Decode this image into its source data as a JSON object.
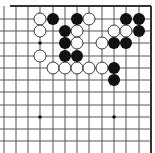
{
  "game": "go",
  "board": {
    "background": "#ffffff",
    "line_color": "#555555",
    "border_color": "#333333",
    "visible_cols": [
      6,
      7,
      8,
      9,
      10,
      11,
      12,
      13,
      14,
      15,
      16,
      17,
      18
    ],
    "visible_rows": [
      0,
      1,
      2,
      3,
      4,
      5,
      6,
      7,
      8,
      9,
      10,
      11
    ],
    "col_x": {
      "6": 4,
      "7": 16,
      "8": 28,
      "9": 40,
      "10": 53,
      "11": 65,
      "12": 77,
      "13": 89,
      "14": 102,
      "15": 114,
      "16": 126,
      "17": 139,
      "18": 151
    },
    "row_y": {
      "0": 6,
      "1": 19,
      "2": 31,
      "3": 43,
      "4": 56,
      "5": 68,
      "6": 80,
      "7": 92,
      "8": 105,
      "9": 117,
      "10": 129,
      "11": 141
    },
    "hoshi": [
      [
        9,
        3
      ],
      [
        15,
        3
      ],
      [
        9,
        9
      ],
      [
        15,
        9
      ]
    ],
    "stones": [
      {
        "color": "white",
        "col": 9,
        "row": 1
      },
      {
        "color": "black",
        "col": 10,
        "row": 1
      },
      {
        "color": "black",
        "col": 12,
        "row": 1
      },
      {
        "color": "white",
        "col": 13,
        "row": 1
      },
      {
        "color": "black",
        "col": 16,
        "row": 1
      },
      {
        "color": "black",
        "col": 17,
        "row": 1
      },
      {
        "color": "white",
        "col": 9,
        "row": 2
      },
      {
        "color": "black",
        "col": 11,
        "row": 2
      },
      {
        "color": "white",
        "col": 12,
        "row": 2
      },
      {
        "color": "white",
        "col": 15,
        "row": 2
      },
      {
        "color": "white",
        "col": 16,
        "row": 2
      },
      {
        "color": "black",
        "col": 17,
        "row": 2
      },
      {
        "color": "black",
        "col": 11,
        "row": 3
      },
      {
        "color": "white",
        "col": 12,
        "row": 3
      },
      {
        "color": "white",
        "col": 14,
        "row": 3
      },
      {
        "color": "black",
        "col": 15,
        "row": 3
      },
      {
        "color": "black",
        "col": 16,
        "row": 3
      },
      {
        "color": "white",
        "col": 9,
        "row": 4
      },
      {
        "color": "black",
        "col": 11,
        "row": 4
      },
      {
        "color": "black",
        "col": 12,
        "row": 4
      },
      {
        "color": "white",
        "col": 10,
        "row": 5
      },
      {
        "color": "white",
        "col": 11,
        "row": 5
      },
      {
        "color": "white",
        "col": 12,
        "row": 5
      },
      {
        "color": "white",
        "col": 13,
        "row": 5
      },
      {
        "color": "white",
        "col": 14,
        "row": 5
      },
      {
        "color": "black",
        "col": 15,
        "row": 5
      },
      {
        "color": "black",
        "col": 15,
        "row": 6
      }
    ],
    "stone_radius": 6,
    "colors": {
      "black": "#111111",
      "white": "#ffffff",
      "white_stroke": "#222222"
    }
  }
}
